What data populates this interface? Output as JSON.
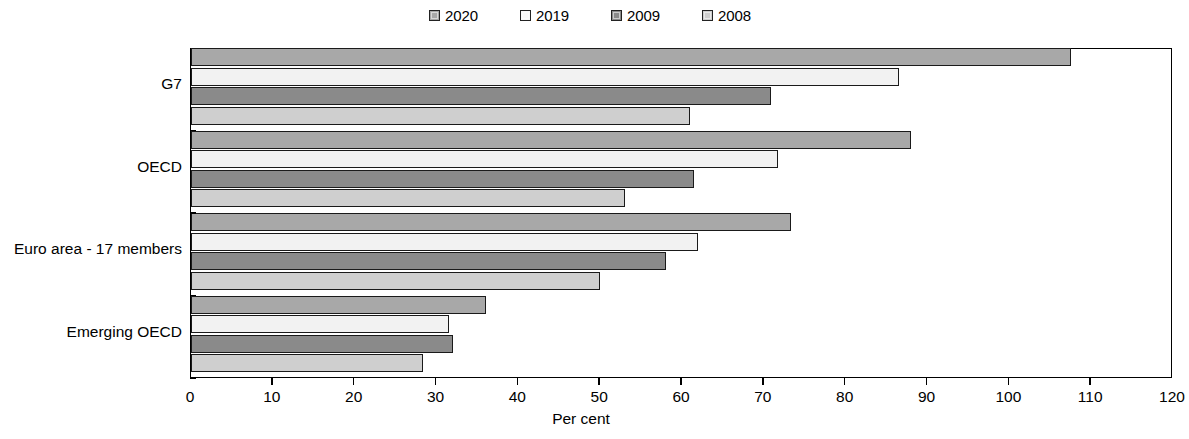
{
  "chart_data": {
    "type": "bar",
    "orientation": "horizontal",
    "title": "",
    "subtitle": "",
    "xlabel": "Per cent",
    "ylabel": "",
    "xlim": [
      0,
      120
    ],
    "xticks": [
      0,
      10,
      20,
      30,
      40,
      50,
      60,
      70,
      80,
      90,
      100,
      110,
      120
    ],
    "xtick_labels": [
      "0",
      "10",
      "20",
      "30",
      "40",
      "50",
      "60",
      "70",
      "80",
      "90",
      "100",
      "110",
      "120"
    ],
    "grid": false,
    "legend_position": "top-center",
    "categories": [
      "G7",
      "OECD",
      "Euro area - 17 members",
      "Emerging OECD"
    ],
    "series": [
      {
        "name": "2020",
        "color": "#a8a8a8",
        "values": [
          107.5,
          88.0,
          73.3,
          36.0
        ]
      },
      {
        "name": "2019",
        "color": "#f2f2f2",
        "values": [
          86.5,
          71.7,
          62.0,
          31.5
        ]
      },
      {
        "name": "2009",
        "color": "#8a8a8a",
        "values": [
          70.9,
          61.5,
          58.0,
          32.0
        ]
      },
      {
        "name": "2008",
        "color": "#cfcfcf",
        "values": [
          61.0,
          53.0,
          50.0,
          28.4
        ]
      }
    ],
    "series_order_top_to_bottom": [
      "2020",
      "2019",
      "2009",
      "2008"
    ]
  },
  "legend": {
    "items": [
      {
        "label": "2020",
        "swatch": "#a8a8a8"
      },
      {
        "label": "2019",
        "swatch": "#f7f7f7"
      },
      {
        "label": "2009",
        "swatch": "#8a8a8a"
      },
      {
        "label": "2008",
        "swatch": "#cfcfcf"
      }
    ]
  },
  "axis": {
    "x_title": "Per cent",
    "x_tick_labels": [
      "0",
      "10",
      "20",
      "30",
      "40",
      "50",
      "60",
      "70",
      "80",
      "90",
      "100",
      "110",
      "120"
    ],
    "y_tick_labels": [
      "G7",
      "OECD",
      "Euro area - 17 members",
      "Emerging OECD"
    ]
  }
}
